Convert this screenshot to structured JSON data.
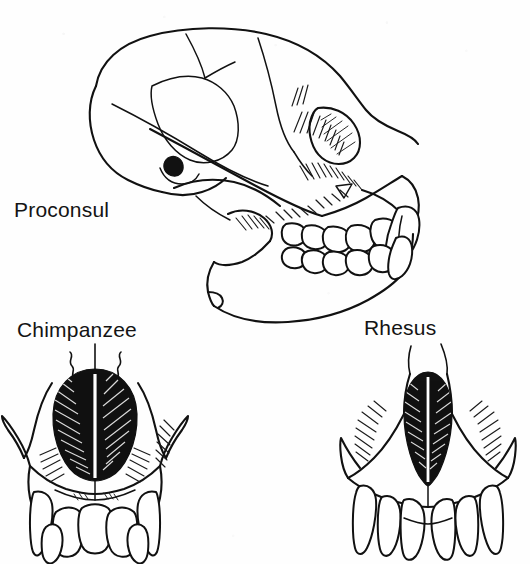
{
  "figure": {
    "background_color": "#fefefe",
    "ink_color": "#111111",
    "width": 530,
    "height": 564
  },
  "labels": {
    "proconsul": "Proconsul",
    "chimpanzee": "Chimpanzee",
    "rhesus": "Rhesus"
  },
  "panels": [
    {
      "id": "proconsul-skull",
      "label": "Proconsul",
      "view": "lateral",
      "description": "Line drawing of a Proconsul skull in left lateral view showing braincase, orbit, zygomatic arch, auditory meatus, muzzle, upper and lower tooth rows and a large projecting canine.",
      "features": [
        "braincase",
        "temporal-line",
        "orbit",
        "zygomatic-arch",
        "auditory-meatus",
        "nasal-aperture",
        "maxilla",
        "mandible",
        "upper-tooth-row",
        "lower-tooth-row",
        "canine"
      ]
    },
    {
      "id": "chimpanzee-face",
      "label": "Chimpanzee",
      "view": "anterior",
      "description": "Anterior view of a chimpanzee facial skeleton with a broad heart-shaped dark nasal aperture, nasal septum, zygomatic pillars and an incisor-canine row below.",
      "nasal_aperture_shape": "broad pear / heart-shaped",
      "features": [
        "nasal-aperture",
        "nasal-septum",
        "zygomatic-process-left",
        "zygomatic-process-right",
        "canine-left",
        "canine-right",
        "incisor-row"
      ]
    },
    {
      "id": "rhesus-face",
      "label": "Rhesus",
      "view": "anterior",
      "description": "Anterior view of a rhesus macaque facial skeleton with a narrow oval dark nasal aperture, nasal septum, flaring zygomatic arches and a procumbent incisor-canine row below.",
      "nasal_aperture_shape": "narrow oval",
      "features": [
        "nasal-aperture",
        "nasal-septum",
        "zygomatic-process-left",
        "zygomatic-process-right",
        "canine-left",
        "canine-right",
        "incisor-row"
      ]
    }
  ]
}
